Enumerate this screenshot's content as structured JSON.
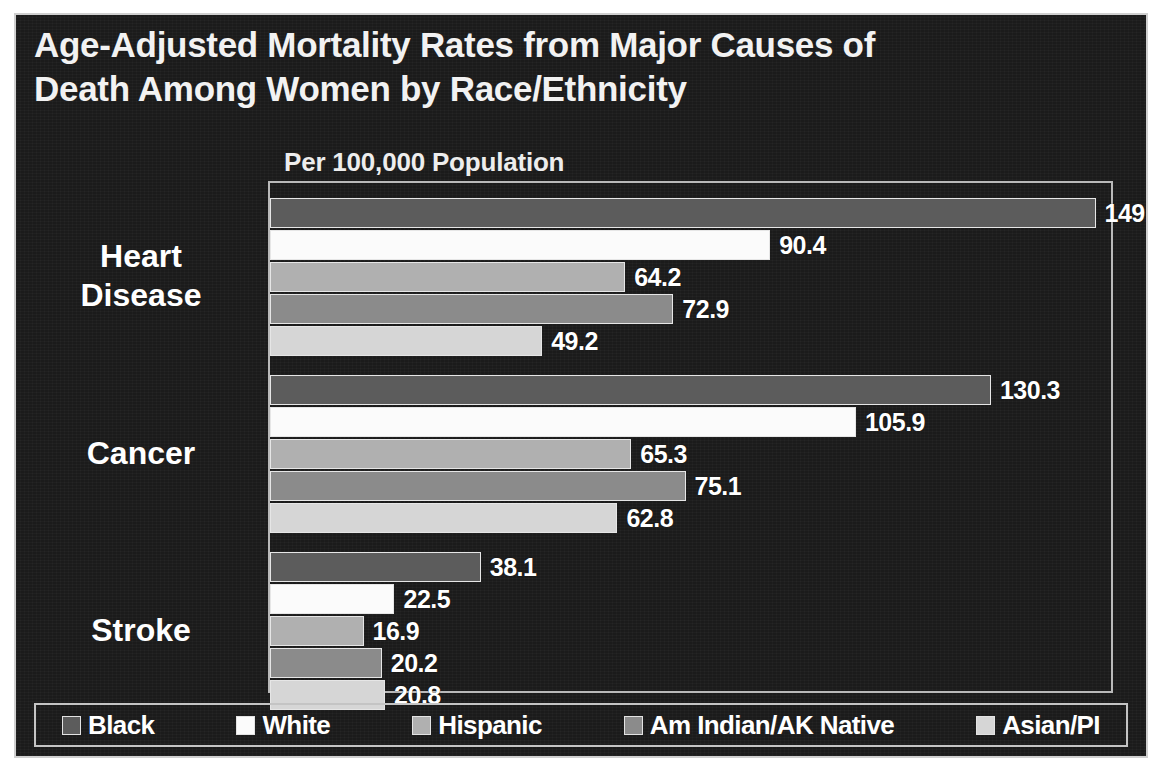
{
  "chart_data": {
    "type": "bar",
    "orientation": "horizontal",
    "title": "Age-Adjusted Mortality Rates from Major Causes of Death Among Women by Race/Ethnicity",
    "title_lines": [
      "Age-Adjusted Mortality Rates from Major Causes of",
      "Death Among Women by Race/Ethnicity"
    ],
    "subtitle": "Per 100,000 Population",
    "xlabel": "",
    "ylabel": "",
    "xlim": [
      0,
      152
    ],
    "grid": false,
    "legend_position": "bottom",
    "categories": [
      "Heart Disease",
      "Cancer",
      "Stroke"
    ],
    "series": [
      {
        "name": "Black",
        "color": "#5c5c5c",
        "values": [
          149.2,
          130.3,
          38.1
        ]
      },
      {
        "name": "White",
        "color": "#fbfbfb",
        "values": [
          90.4,
          105.9,
          22.5
        ]
      },
      {
        "name": "Hispanic",
        "color": "#b0b0b0",
        "values": [
          64.2,
          65.3,
          16.9
        ]
      },
      {
        "name": "Am Indian/AK Native",
        "color": "#8b8b8b",
        "values": [
          72.9,
          75.1,
          20.2
        ]
      },
      {
        "name": "Asian/PI",
        "color": "#d6d6d6",
        "values": [
          49.2,
          62.8,
          20.8
        ]
      }
    ],
    "data_labels": {
      "Heart Disease": [
        "149.2",
        "90.4",
        "64.2",
        "72.9",
        "49.2"
      ],
      "Cancer": [
        "130.3",
        "105.9",
        "65.3",
        "75.1",
        "62.8"
      ],
      "Stroke": [
        "38.1",
        "22.5",
        "16.9",
        "20.2",
        "20.8"
      ]
    }
  },
  "colors": {
    "background": "#1b1b1b",
    "frame": "#cfcfcf",
    "text": "#ffffff",
    "plot_border": "#b9b9b9"
  },
  "category_labels": [
    {
      "lines": [
        "Heart",
        "Disease"
      ]
    },
    {
      "lines": [
        "Cancer"
      ]
    },
    {
      "lines": [
        "Stroke"
      ]
    }
  ],
  "legend": {
    "items": [
      {
        "label": "Black",
        "color": "#5c5c5c"
      },
      {
        "label": "White",
        "color": "#fbfbfb"
      },
      {
        "label": "Hispanic",
        "color": "#b0b0b0"
      },
      {
        "label": "Am Indian/AK Native",
        "color": "#8b8b8b"
      },
      {
        "label": "Asian/PI",
        "color": "#d6d6d6"
      }
    ]
  }
}
